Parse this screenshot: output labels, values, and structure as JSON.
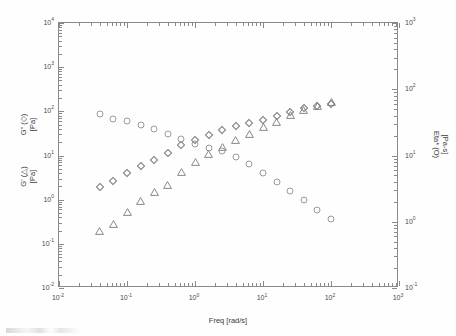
{
  "figure": {
    "background_color": "#fefefe",
    "frame_color": "#8a8a8a",
    "marker_color": "#8a8a8a"
  },
  "axes": {
    "x": {
      "title": "Freq [rad/s]",
      "scale": "log",
      "min_exp": -2,
      "max_exp": 3,
      "tick_labels": [
        "10-2",
        "10-1",
        "100",
        "101",
        "102",
        "103"
      ],
      "tick_mantissas": [
        "10",
        "10",
        "10",
        "10",
        "10",
        "10"
      ],
      "tick_exponents": [
        "-2",
        "-1",
        "0",
        "1",
        "2",
        "3"
      ]
    },
    "y_left": {
      "title_line1": "G' (△)",
      "title_line2": "[Pa]",
      "title_line3": "G\" (◇)",
      "title_line4": "[Pa]",
      "scale": "log",
      "min_exp": -2,
      "max_exp": 4,
      "tick_exponents": [
        "-2",
        "-1",
        "0",
        "1",
        "2",
        "3",
        "4"
      ],
      "tick_mantissa": "10"
    },
    "y_right": {
      "title_line1": "Eta* (O)",
      "title_line2": "[Pa-s]",
      "scale": "log",
      "min_exp": -1,
      "max_exp": 3,
      "tick_exponents": [
        "-1",
        "0",
        "1",
        "2",
        "3"
      ],
      "tick_mantissa": "10"
    }
  },
  "chart_data": {
    "type": "scatter",
    "title": "",
    "subtitle": "",
    "xlabel": "Freq [rad/s]",
    "ylabel": "G' (△) [Pa]   G\" (◇) [Pa]",
    "y2label": "Eta* (O) [Pa-s]",
    "xscale": "log",
    "yscale": "log",
    "xlim": [
      0.01,
      1000
    ],
    "ylim": [
      0.01,
      10000
    ],
    "y2lim": [
      0.1,
      1000
    ],
    "grid": false,
    "legend": "none (symbols identified in axis titles)",
    "series": [
      {
        "name": "G' (triangle)",
        "marker": "triangle",
        "axis": "left",
        "unit": "Pa",
        "x": [
          0.04,
          0.063,
          0.1,
          0.158,
          0.25,
          0.4,
          0.63,
          1.0,
          1.58,
          2.5,
          4.0,
          6.3,
          10.0,
          15.8,
          25.0,
          40.0,
          63.0,
          100.0
        ],
        "y": [
          0.27,
          0.38,
          0.72,
          1.25,
          2.0,
          3.0,
          5.8,
          9.5,
          14.5,
          21.0,
          30.0,
          42.0,
          60.0,
          80.0,
          115.0,
          150.0,
          185.0,
          225.0
        ]
      },
      {
        "name": "G'' (diamond)",
        "marker": "diamond",
        "axis": "left",
        "unit": "Pa",
        "x": [
          0.04,
          0.063,
          0.1,
          0.158,
          0.25,
          0.4,
          0.63,
          1.0,
          1.58,
          2.5,
          4.0,
          6.3,
          10.0,
          15.8,
          25.0,
          40.0,
          63.0,
          100.0
        ],
        "y": [
          1.9,
          2.6,
          4.0,
          5.8,
          8.0,
          11.5,
          17.0,
          22.0,
          29.0,
          37.0,
          47.0,
          55.0,
          63.0,
          78.0,
          98.0,
          118.0,
          135.0,
          150.0
        ]
      },
      {
        "name": "Eta* (circle)",
        "marker": "circle",
        "axis": "right",
        "unit": "Pa-s",
        "x": [
          0.04,
          0.063,
          0.1,
          0.158,
          0.25,
          0.4,
          0.63,
          1.0,
          1.58,
          2.5,
          4.0,
          6.3,
          10.0,
          15.8,
          25.0,
          40.0,
          63.0,
          100.0
        ],
        "y": [
          43.0,
          36.0,
          33.0,
          29.0,
          25.0,
          21.0,
          18.0,
          15.0,
          13.0,
          11.5,
          9.5,
          7.5,
          5.5,
          4.0,
          2.9,
          2.1,
          1.5,
          1.1
        ]
      }
    ]
  }
}
